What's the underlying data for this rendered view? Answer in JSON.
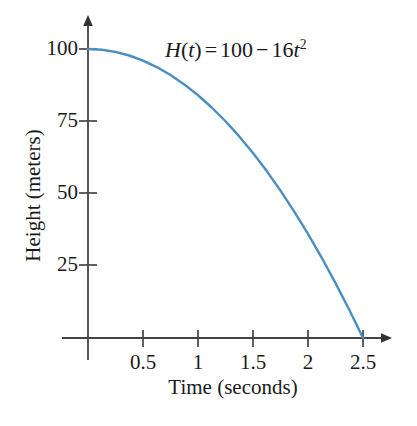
{
  "chart_data": {
    "type": "line",
    "title": "",
    "annotation": {
      "function_name": "H",
      "variable": "t",
      "text": "H(t) = 100 - 16t^2",
      "lhs": "H(t)",
      "equals": "=",
      "constant": "100",
      "minus": "−",
      "coefficient": "16",
      "exponent": "2"
    },
    "xlabel": "Time (seconds)",
    "ylabel": "Height (meters)",
    "xlim": [
      0,
      2.7
    ],
    "ylim": [
      0,
      108
    ],
    "xticks": [
      0.5,
      1,
      1.5,
      2,
      2.5
    ],
    "xtick_labels": [
      "0.5",
      "1",
      "1.5",
      "2",
      "2.5"
    ],
    "yticks": [
      25,
      50,
      75,
      100
    ],
    "ytick_labels": [
      "25",
      "50",
      "75",
      "100"
    ],
    "grid": false,
    "legend": null,
    "series": [
      {
        "name": "H(t) = 100 - 16t^2",
        "color": "#4a8ec2",
        "x": [
          0,
          0.125,
          0.25,
          0.375,
          0.5,
          0.625,
          0.75,
          0.875,
          1,
          1.125,
          1.25,
          1.375,
          1.5,
          1.625,
          1.75,
          1.875,
          2,
          2.125,
          2.25,
          2.375,
          2.5
        ],
        "y": [
          100,
          99.75,
          99,
          97.75,
          96,
          93.75,
          91,
          87.75,
          84,
          79.75,
          75,
          69.75,
          64,
          57.75,
          51,
          43.75,
          36,
          27.75,
          19,
          9.75,
          0
        ]
      }
    ]
  },
  "axes": {
    "x_axis_name": "horizontal-axis",
    "y_axis_name": "vertical-axis"
  }
}
